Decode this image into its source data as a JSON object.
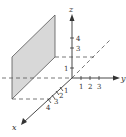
{
  "diagram": {
    "type": "3d-coordinate-axes",
    "axes": {
      "x": {
        "label": "x",
        "ticks": [
          "1",
          "2",
          "3",
          "4"
        ]
      },
      "y": {
        "label": "y",
        "ticks": [
          "1",
          "2",
          "3"
        ]
      },
      "z": {
        "label": "z",
        "ticks": [
          "1",
          "3",
          "4"
        ]
      }
    },
    "plane": {
      "fill": "#d8d8d8",
      "stroke": "#555555"
    },
    "colors": {
      "axis": "#333333",
      "dashed": "#555555"
    }
  }
}
